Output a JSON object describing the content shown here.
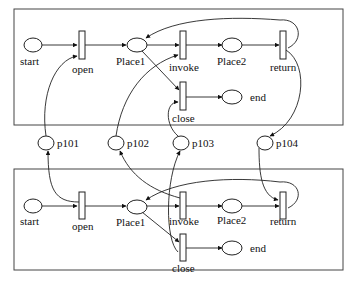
{
  "diagram": {
    "type": "petri-net",
    "nets": [
      {
        "id": "top",
        "places": [
          "start",
          "Place1",
          "Place2",
          "end"
        ],
        "transitions": [
          "open",
          "invoke",
          "return",
          "close"
        ]
      },
      {
        "id": "bottom",
        "places": [
          "start",
          "Place1",
          "Place2",
          "end"
        ],
        "transitions": [
          "open",
          "invoke",
          "return",
          "close"
        ]
      }
    ],
    "interface_places": [
      "p101",
      "p102",
      "p103",
      "p104"
    ],
    "labels": {
      "top": {
        "start": "start",
        "open": "open",
        "place1": "Place1",
        "invoke": "invoke",
        "place2": "Place2",
        "return": "return",
        "close": "close",
        "end": "end"
      },
      "interface": {
        "p101": "p101",
        "p102": "p102",
        "p103": "p103",
        "p104": "p104"
      },
      "bottom": {
        "start": "start",
        "open": "open",
        "place1": "Place1",
        "invoke": "invoke",
        "place2": "Place2",
        "return": "return",
        "close": "close",
        "end": "end"
      }
    },
    "arcs": [
      {
        "from": "top.start",
        "to": "top.open"
      },
      {
        "from": "top.open",
        "to": "top.Place1"
      },
      {
        "from": "top.Place1",
        "to": "top.invoke"
      },
      {
        "from": "top.invoke",
        "to": "top.Place2"
      },
      {
        "from": "top.Place2",
        "to": "top.return"
      },
      {
        "from": "top.return",
        "to": "top.Place1"
      },
      {
        "from": "top.Place1",
        "to": "top.close"
      },
      {
        "from": "top.close",
        "to": "top.end"
      },
      {
        "from": "p101",
        "to": "top.open"
      },
      {
        "from": "p102",
        "to": "top.invoke"
      },
      {
        "from": "p103",
        "to": "top.close"
      },
      {
        "from": "top.return",
        "to": "p104"
      },
      {
        "from": "bottom.start",
        "to": "bottom.open"
      },
      {
        "from": "bottom.open",
        "to": "bottom.Place1"
      },
      {
        "from": "bottom.Place1",
        "to": "bottom.invoke"
      },
      {
        "from": "bottom.invoke",
        "to": "bottom.Place2"
      },
      {
        "from": "bottom.Place2",
        "to": "bottom.return"
      },
      {
        "from": "bottom.return",
        "to": "bottom.Place1"
      },
      {
        "from": "bottom.Place1",
        "to": "bottom.close"
      },
      {
        "from": "bottom.close",
        "to": "bottom.end"
      },
      {
        "from": "bottom.open",
        "to": "p101"
      },
      {
        "from": "bottom.invoke",
        "to": "p102"
      },
      {
        "from": "bottom.close",
        "to": "p103"
      },
      {
        "from": "p104",
        "to": "bottom.return"
      }
    ]
  }
}
